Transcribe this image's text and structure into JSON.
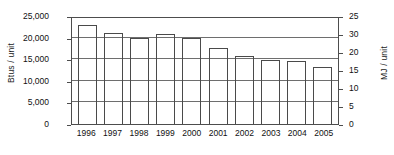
{
  "chart_data": {
    "type": "bar",
    "title": "",
    "subtitle": "",
    "xlabel": "",
    "ylabel": "Btus / unit",
    "ylabel_secondary": "MJ / unit",
    "categories": [
      "1996",
      "1997",
      "1998",
      "1999",
      "2000",
      "2001",
      "2002",
      "2003",
      "2004",
      "2005"
    ],
    "values": [
      23000,
      21000,
      19800,
      20800,
      20000,
      17700,
      15800,
      14900,
      14500,
      13300
    ],
    "series": [
      {
        "name": "Energy intensity",
        "values": [
          23000,
          21000,
          19800,
          20800,
          20000,
          17700,
          15800,
          14900,
          14500,
          13300
        ]
      }
    ],
    "ylim": [
      0,
      25000
    ],
    "ylim_secondary": [
      0,
      30
    ],
    "yticks": [
      0,
      5000,
      10000,
      15000,
      20000,
      25000
    ],
    "ytick_labels": [
      "0",
      "5,000",
      "10,000",
      "15,000",
      "20,000",
      "25,000"
    ],
    "yticks_secondary": [
      0,
      5,
      10,
      15,
      20,
      25,
      30
    ],
    "ytick_labels_secondary": [
      "0",
      "5",
      "10",
      "15",
      "20",
      "30",
      "25"
    ],
    "grid": true,
    "grid_axis": "y",
    "legend": false,
    "legend_position": "none",
    "bar_fill": "#ffffff",
    "bar_edge": "#4a4a4a",
    "axis_color": "#4d4d4d",
    "grid_color": "#6e6e6e",
    "background": "#ffffff"
  },
  "axes": {
    "left_title": "Btus / unit",
    "right_title": "MJ / unit"
  }
}
